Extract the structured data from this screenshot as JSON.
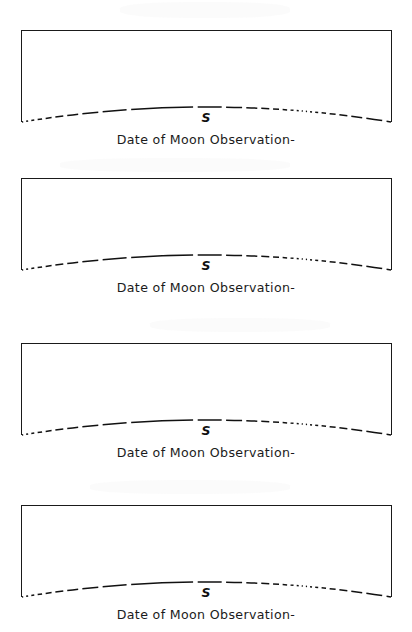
{
  "document": {
    "title": "Moon Observation Record Sheet",
    "paper_color": "#ffffff",
    "ink_color": "#111111"
  },
  "panels": [
    {
      "id": "panel-1",
      "top": 30,
      "caption": "Date of Moon Observation-",
      "direction_label": "S",
      "direction_meaning": "south",
      "box": {
        "left": 21,
        "width": 371,
        "height": 92
      },
      "horizon": {
        "style": "dashed-arc",
        "peak_label": "S"
      }
    },
    {
      "id": "panel-2",
      "top": 178,
      "caption": "Date of Moon Observation-",
      "direction_label": "S",
      "direction_meaning": "south",
      "box": {
        "left": 21,
        "width": 371,
        "height": 92
      },
      "horizon": {
        "style": "dashed-arc",
        "peak_label": "S"
      }
    },
    {
      "id": "panel-3",
      "top": 343,
      "caption": "Date of Moon Observation-",
      "direction_label": "S",
      "direction_meaning": "south",
      "box": {
        "left": 21,
        "width": 371,
        "height": 92
      },
      "horizon": {
        "style": "dashed-arc",
        "peak_label": "S"
      }
    },
    {
      "id": "panel-4",
      "top": 505,
      "caption": "Date of Moon Observation-",
      "direction_label": "S",
      "direction_meaning": "south",
      "box": {
        "left": 21,
        "width": 371,
        "height": 92
      },
      "horizon": {
        "style": "dashed-arc",
        "peak_label": "S"
      }
    }
  ]
}
